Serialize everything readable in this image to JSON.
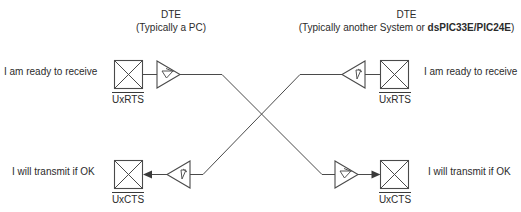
{
  "diagram": {
    "title_semantic": "dte-to-dte-hardware-flow-control-crossover",
    "headers": {
      "left": {
        "line1": "DTE",
        "line2_prefix": "(Typically a PC)"
      },
      "right": {
        "line1": "DTE",
        "line2_prefix": "(Typically another System or ",
        "line2_bold": "dsPIC33E/PIC24E",
        "line2_suffix": ")"
      }
    },
    "annotations": {
      "top_left": "I am ready to receive",
      "top_right": "I am ready to receive",
      "bottom_left": "I will transmit if OK",
      "bottom_right": "I will transmit if OK"
    },
    "signals": {
      "top_left": "UxRTS",
      "top_right": "UxRTS",
      "bottom_left": "UxCTS",
      "bottom_right": "UxCTS"
    },
    "colors": {
      "stroke": "#4a4a4a",
      "text": "#2b2b2b",
      "arrow": "#3a3a3a",
      "background": "#ffffff"
    },
    "nodes": {
      "left_rts_pad": {
        "x": 114,
        "y": 60,
        "w": 28,
        "h": 28,
        "type": "crossed-box"
      },
      "left_rts_driver": {
        "x": 156,
        "y": 61,
        "dir": "right",
        "type": "line-driver"
      },
      "right_rts_receiver": {
        "x": 342,
        "y": 61,
        "dir": "left",
        "type": "line-receiver"
      },
      "right_rts_pad": {
        "x": 380,
        "y": 60,
        "w": 28,
        "h": 28,
        "type": "crossed-box"
      },
      "left_cts_pad": {
        "x": 114,
        "y": 160,
        "w": 28,
        "h": 28,
        "type": "crossed-box"
      },
      "left_cts_receiver": {
        "x": 166,
        "y": 161,
        "dir": "left",
        "type": "line-receiver"
      },
      "right_cts_driver": {
        "x": 334,
        "y": 161,
        "dir": "right",
        "type": "line-driver"
      },
      "right_cts_pad": {
        "x": 380,
        "y": 160,
        "w": 28,
        "h": 28,
        "type": "crossed-box"
      }
    },
    "links": [
      {
        "from": "left_rts_driver",
        "to": "right_cts_driver",
        "label_semantic": "left-rts-to-right-cts"
      },
      {
        "from": "right_rts_receiver",
        "to": "left_cts_receiver",
        "label_semantic": "right-rts-to-left-cts"
      }
    ]
  }
}
